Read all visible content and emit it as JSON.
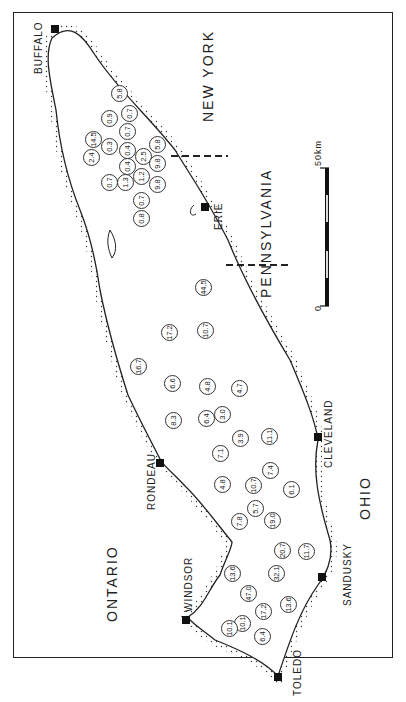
{
  "map": {
    "subject": "Lake Erie",
    "orientation": "rotated 90 degrees counter-clockwise",
    "regions": [
      {
        "id": "new-york",
        "label": "NEW YORK",
        "x": 200,
        "y": 122,
        "big": true
      },
      {
        "id": "pennsylvania",
        "label": "PENNSYLVANIA",
        "x": 258,
        "y": 298,
        "big": true
      },
      {
        "id": "ohio",
        "label": "OHIO",
        "x": 357,
        "y": 520,
        "big": true
      },
      {
        "id": "ontario",
        "label": "ONTARIO",
        "x": 104,
        "y": 622,
        "big": true
      }
    ],
    "cities": [
      {
        "id": "buffalo",
        "label": "BUFFALO",
        "mx": 55,
        "my": 29,
        "lx": 33,
        "ly": 74
      },
      {
        "id": "erie",
        "label": "ERIE",
        "mx": 205,
        "my": 207,
        "lx": 213,
        "ly": 230
      },
      {
        "id": "cleveland",
        "label": "CLEVELAND",
        "mx": 318,
        "my": 437,
        "lx": 323,
        "ly": 468
      },
      {
        "id": "rondeau",
        "label": "RONDEAU",
        "mx": 160,
        "my": 463,
        "lx": 146,
        "ly": 510
      },
      {
        "id": "sandusky",
        "label": "SANDUSKY",
        "mx": 322,
        "my": 577,
        "lx": 342,
        "ly": 606
      },
      {
        "id": "windsor",
        "label": "WINDSOR",
        "mx": 186,
        "my": 620,
        "lx": 183,
        "ly": 612
      },
      {
        "id": "toledo",
        "label": "TOLEDO",
        "mx": 278,
        "my": 677,
        "lx": 292,
        "ly": 696
      }
    ],
    "scale_bar": {
      "label": "50km",
      "zero_label": "0",
      "x": 327,
      "y_top": 168,
      "y_bottom": 306
    },
    "sites": [
      {
        "v": "5.8",
        "x": 119,
        "y": 93
      },
      {
        "v": "0.9",
        "x": 109,
        "y": 118
      },
      {
        "v": "0.7",
        "x": 129,
        "y": 113
      },
      {
        "v": "14.5",
        "x": 93,
        "y": 139
      },
      {
        "v": "0.3",
        "x": 109,
        "y": 146
      },
      {
        "v": "0.7",
        "x": 127,
        "y": 131
      },
      {
        "v": "0.4",
        "x": 127,
        "y": 150
      },
      {
        "v": "5.8",
        "x": 157,
        "y": 144
      },
      {
        "v": "2.4",
        "x": 91,
        "y": 157
      },
      {
        "v": "0.4",
        "x": 127,
        "y": 166
      },
      {
        "v": "2.5",
        "x": 143,
        "y": 156
      },
      {
        "v": "9.8",
        "x": 157,
        "y": 163
      },
      {
        "v": "0.7",
        "x": 109,
        "y": 182
      },
      {
        "v": "1.3",
        "x": 125,
        "y": 182
      },
      {
        "v": "1.2",
        "x": 141,
        "y": 176
      },
      {
        "v": "9.8",
        "x": 157,
        "y": 184
      },
      {
        "v": "0.7",
        "x": 141,
        "y": 200
      },
      {
        "v": "0.8",
        "x": 141,
        "y": 218
      },
      {
        "v": "44.5",
        "x": 203,
        "y": 287
      },
      {
        "v": "17.2",
        "x": 169,
        "y": 332
      },
      {
        "v": "10.7",
        "x": 205,
        "y": 330
      },
      {
        "v": "16.7",
        "x": 138,
        "y": 366
      },
      {
        "v": "6.6",
        "x": 172,
        "y": 383
      },
      {
        "v": "4.8",
        "x": 207,
        "y": 386
      },
      {
        "v": "4.7",
        "x": 239,
        "y": 388
      },
      {
        "v": "8.3",
        "x": 173,
        "y": 420
      },
      {
        "v": "6.4",
        "x": 206,
        "y": 418
      },
      {
        "v": "3.0",
        "x": 222,
        "y": 414
      },
      {
        "v": "3.9",
        "x": 240,
        "y": 438
      },
      {
        "v": "11.1",
        "x": 269,
        "y": 436
      },
      {
        "v": "7.1",
        "x": 220,
        "y": 453
      },
      {
        "v": "7.4",
        "x": 270,
        "y": 470
      },
      {
        "v": "4.8",
        "x": 222,
        "y": 484
      },
      {
        "v": "10.7",
        "x": 253,
        "y": 485
      },
      {
        "v": "6.1",
        "x": 291,
        "y": 489
      },
      {
        "v": "5.7",
        "x": 255,
        "y": 508
      },
      {
        "v": "7.8",
        "x": 239,
        "y": 521
      },
      {
        "v": "19.0",
        "x": 272,
        "y": 520
      },
      {
        "v": "20.7",
        "x": 282,
        "y": 550
      },
      {
        "v": "11.7",
        "x": 306,
        "y": 551
      },
      {
        "v": "13.6",
        "x": 232,
        "y": 573
      },
      {
        "v": "32.1",
        "x": 276,
        "y": 573
      },
      {
        "v": "47.0",
        "x": 248,
        "y": 593
      },
      {
        "v": "17.2",
        "x": 263,
        "y": 611
      },
      {
        "v": "13.6",
        "x": 288,
        "y": 604
      },
      {
        "v": "10.1",
        "x": 242,
        "y": 623
      },
      {
        "v": "10.1",
        "x": 229,
        "y": 628
      },
      {
        "v": "6.4",
        "x": 262,
        "y": 636
      }
    ],
    "colors": {
      "line": "#222222",
      "background": "#ffffff",
      "marker": "#111111"
    }
  }
}
